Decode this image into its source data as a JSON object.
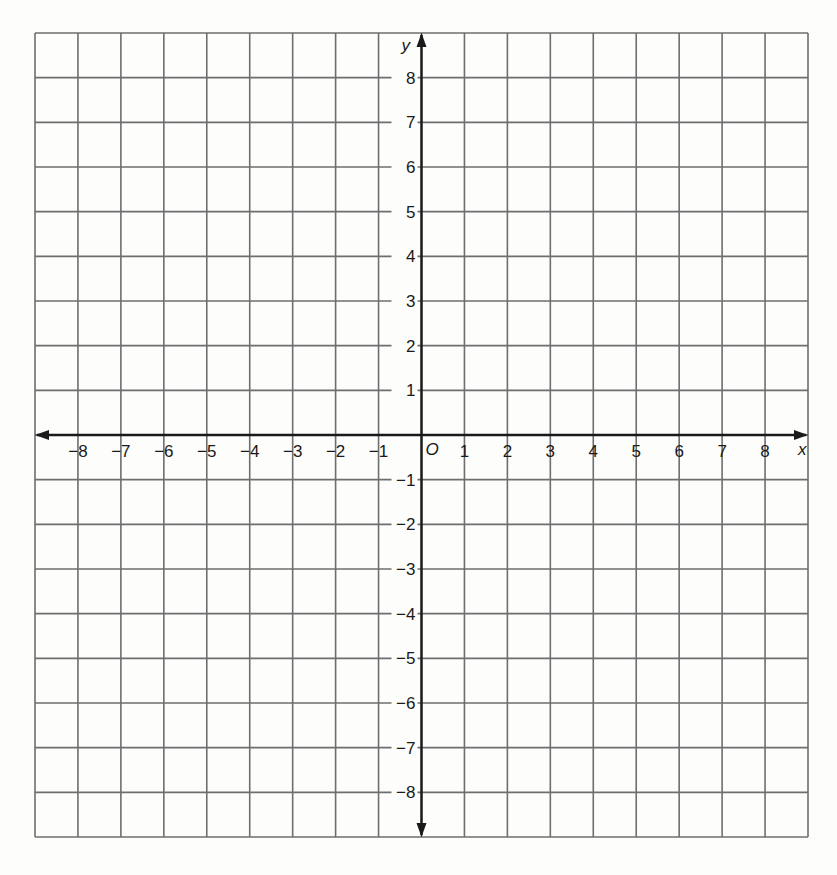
{
  "chart_data": {
    "type": "scatter",
    "title": "",
    "xlabel": "x",
    "ylabel": "y",
    "origin_label": "O",
    "xlim": [
      -9,
      9
    ],
    "ylim": [
      -9,
      9
    ],
    "grid": true,
    "grid_step": 1,
    "x_ticks": [
      -8,
      -7,
      -6,
      -5,
      -4,
      -3,
      -2,
      -1,
      1,
      2,
      3,
      4,
      5,
      6,
      7,
      8
    ],
    "y_ticks": [
      -8,
      -7,
      -6,
      -5,
      -4,
      -3,
      -2,
      -1,
      1,
      2,
      3,
      4,
      5,
      6,
      7,
      8
    ],
    "x_tick_labels": [
      "−8",
      "−7",
      "−6",
      "−5",
      "−4",
      "−3",
      "−2",
      "−1",
      "1",
      "2",
      "3",
      "4",
      "5",
      "6",
      "7",
      "8"
    ],
    "y_tick_labels": [
      "−8",
      "−7",
      "−6",
      "−5",
      "−4",
      "−3",
      "−2",
      "−1",
      "1",
      "2",
      "3",
      "4",
      "5",
      "6",
      "7",
      "8"
    ],
    "series": [],
    "legend": null,
    "colors": {
      "grid": "#6e6e6e",
      "axis": "#1a1a1a",
      "background": "#fdfdfc"
    }
  }
}
